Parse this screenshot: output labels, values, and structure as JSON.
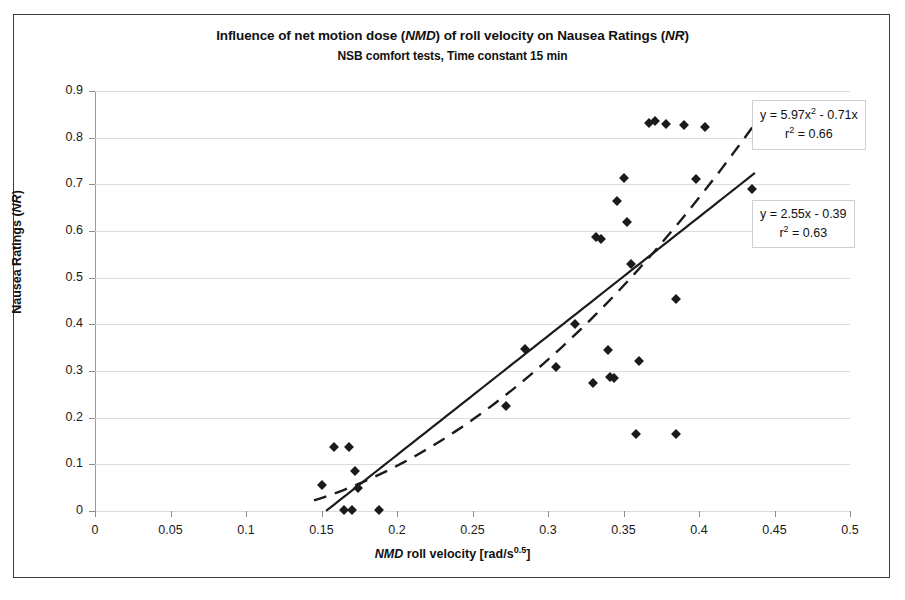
{
  "chart_data": {
    "type": "scatter",
    "title": "Influence of net motion dose (NMD) of roll velocity on Nausea Ratings (NR)",
    "title_parts": {
      "a": "Influence of net motion dose (",
      "i1": "NMD",
      "b": ") of roll velocity on Nausea Ratings (",
      "i2": "NR",
      "c": ")"
    },
    "subtitle": "NSB  comfort tests, Time constant 15 min",
    "xlabel": "NMD roll velocity [rad/s^0.5]",
    "xlabel_parts": {
      "i": "NMD",
      "rest": " roll velocity [rad/s",
      "sup": "0.5",
      "close": "]"
    },
    "ylabel": "Nausea Ratings (NR)",
    "ylabel_parts": {
      "a": "Nausea Ratings (",
      "i": "NR",
      "c": ")"
    },
    "xlim": [
      0,
      0.5
    ],
    "ylim": [
      0,
      0.9
    ],
    "xticks": [
      "0",
      "0.05",
      "0.1",
      "0.15",
      "0.2",
      "0.25",
      "0.3",
      "0.35",
      "0.4",
      "0.45",
      "0.5"
    ],
    "xtick_values": [
      0,
      0.05,
      0.1,
      0.15,
      0.2,
      0.25,
      0.3,
      0.35,
      0.4,
      0.45,
      0.5
    ],
    "yticks": [
      "0",
      "0.1",
      "0.2",
      "0.3",
      "0.4",
      "0.5",
      "0.6",
      "0.7",
      "0.8",
      "0.9"
    ],
    "ytick_values": [
      0,
      0.1,
      0.2,
      0.3,
      0.4,
      0.5,
      0.6,
      0.7,
      0.8,
      0.9
    ],
    "grid": "horizontal",
    "legend": "none",
    "marker": "diamond",
    "marker_color": "#1b1b1b",
    "points": [
      [
        0.15,
        0.055
      ],
      [
        0.158,
        0.138
      ],
      [
        0.168,
        0.138
      ],
      [
        0.165,
        0.002
      ],
      [
        0.17,
        0.002
      ],
      [
        0.172,
        0.085
      ],
      [
        0.174,
        0.05
      ],
      [
        0.188,
        0.002
      ],
      [
        0.272,
        0.225
      ],
      [
        0.285,
        0.348
      ],
      [
        0.305,
        0.308
      ],
      [
        0.318,
        0.4
      ],
      [
        0.33,
        0.275
      ],
      [
        0.332,
        0.588
      ],
      [
        0.335,
        0.583
      ],
      [
        0.34,
        0.345
      ],
      [
        0.341,
        0.288
      ],
      [
        0.344,
        0.285
      ],
      [
        0.346,
        0.665
      ],
      [
        0.35,
        0.714
      ],
      [
        0.352,
        0.62
      ],
      [
        0.355,
        0.53
      ],
      [
        0.358,
        0.165
      ],
      [
        0.36,
        0.322
      ],
      [
        0.367,
        0.832
      ],
      [
        0.371,
        0.835
      ],
      [
        0.378,
        0.83
      ],
      [
        0.385,
        0.455
      ],
      [
        0.385,
        0.165
      ],
      [
        0.39,
        0.828
      ],
      [
        0.398,
        0.712
      ],
      [
        0.404,
        0.822
      ],
      [
        0.435,
        0.69
      ]
    ],
    "trendlines": [
      {
        "name": "quadratic-fit",
        "style": "dashed",
        "equation": "y = 5.97x² - 0.71x",
        "equation_parts": {
          "pre": "y = 5.97x",
          "sup": "2",
          "post": " - 0.71x"
        },
        "r2_label": "r² = 0.66",
        "r2_parts": {
          "pre": "r",
          "sup": "2",
          "post": " = 0.66"
        },
        "r2": 0.66,
        "coefficients": {
          "a": 5.97,
          "b": -0.71,
          "c": 0
        },
        "x_range": [
          0.145,
          0.44
        ]
      },
      {
        "name": "linear-fit",
        "style": "solid",
        "equation": "y = 2.55x - 0.39",
        "equation_parts": {
          "pre": "y = 2.55x - 0.39",
          "sup": "",
          "post": ""
        },
        "r2_label": "r² = 0.63",
        "r2_parts": {
          "pre": "r",
          "sup": "2",
          "post": " = 0.63"
        },
        "r2": 0.63,
        "coefficients": {
          "slope": 2.55,
          "intercept": -0.39
        },
        "x_range": [
          0.153,
          0.437
        ]
      }
    ]
  }
}
